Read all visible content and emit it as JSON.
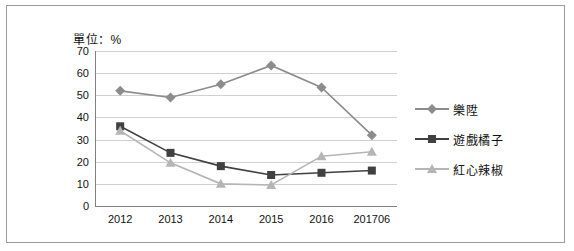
{
  "unit_label": "單位：%",
  "chart_data": {
    "type": "line",
    "title": "",
    "xlabel": "",
    "ylabel": "",
    "unit": "單位：%",
    "categories": [
      "2012",
      "2013",
      "2014",
      "2015",
      "2016",
      "201706"
    ],
    "ylim": [
      0,
      70
    ],
    "yticks": [
      0,
      10,
      20,
      30,
      40,
      50,
      60,
      70
    ],
    "grid": true,
    "legend_position": "right",
    "series": [
      {
        "name": "樂陞",
        "values": [
          52,
          49,
          55,
          63.5,
          53.5,
          32
        ],
        "marker": "diamond",
        "color": "#8c8c8c"
      },
      {
        "name": "遊戲橘子",
        "values": [
          36,
          24,
          18,
          14,
          15,
          16
        ],
        "marker": "square",
        "color": "#404040"
      },
      {
        "name": "紅心辣椒",
        "values": [
          34,
          19.5,
          10,
          9.5,
          22.5,
          24.5
        ],
        "marker": "triangle",
        "color": "#b5b5b5"
      }
    ]
  }
}
